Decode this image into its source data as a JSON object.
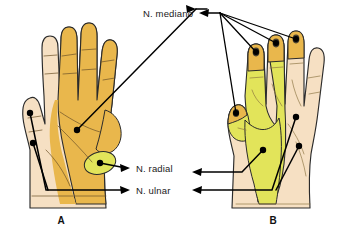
{
  "figure": {
    "panels": [
      {
        "id": "A",
        "label": "A",
        "view": "palmar",
        "description": "Palm of left hand"
      },
      {
        "id": "B",
        "label": "B",
        "view": "dorsal",
        "description": "Back of right hand"
      }
    ]
  },
  "labels": {
    "median": "N. mediano",
    "radial": "N. radial",
    "ulnar": "N. ulnar"
  },
  "colors": {
    "median_territory": "#e9b74c",
    "radial_territory": "#e2e45a",
    "ulnar_territory": "#f3dcc0",
    "skin_pale": "#f6e0c3",
    "outline": "#2b2b2b",
    "leader_line": "#000000",
    "text": "#1a1a1a",
    "background": "#ffffff"
  },
  "icons": {
    "arrow": "arrow-left-icon",
    "marker": "dot-marker-icon"
  }
}
